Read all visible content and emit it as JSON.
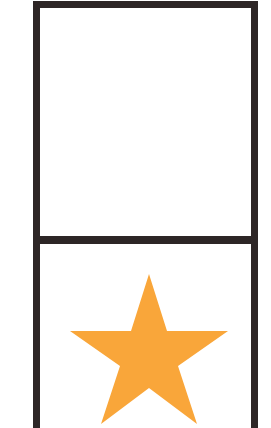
{
  "colors": {
    "frame": "#2d2626",
    "star": "#f9a63a",
    "background": "#ffffff"
  },
  "panels": [
    {
      "id": "top",
      "content": "empty"
    },
    {
      "id": "bottom",
      "content": "star-icon"
    }
  ]
}
